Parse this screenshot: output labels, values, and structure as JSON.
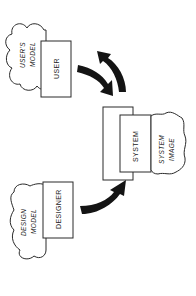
{
  "diagram": {
    "title": "",
    "orientation": "rotated 90deg counter-clockwise",
    "colors": {
      "background": "#ffffff",
      "stroke": "#2a2a2a",
      "arrow": "#141414",
      "text": "#222222"
    },
    "nodes": {
      "user": {
        "label": "USER"
      },
      "users_model": {
        "line1": "USER'S",
        "line2": "MODEL"
      },
      "system": {
        "label": "SYSTEM"
      },
      "system_image": {
        "line1": "SYSTEM",
        "line2": "IMAGE"
      },
      "designer": {
        "label": "DESIGNER"
      },
      "design_model": {
        "line1": "DESIGN",
        "line2": "MODEL"
      }
    },
    "edges": [
      {
        "from": "user",
        "to": "system",
        "style": "curved-thick-arrow"
      },
      {
        "from": "system",
        "to": "user",
        "style": "curved-thick-arrow"
      },
      {
        "from": "designer",
        "to": "system",
        "style": "curved-thick-arrow"
      }
    ]
  }
}
